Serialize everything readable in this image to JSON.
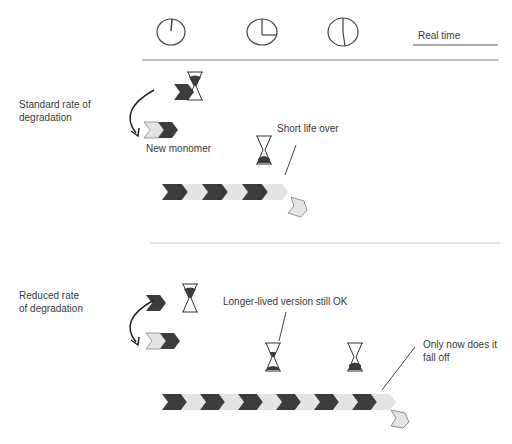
{
  "header": {
    "real_time_label": "Real time",
    "clocks": [
      {
        "name": "clock-start",
        "cx": 171,
        "cy": 32
      },
      {
        "name": "clock-quarter",
        "cx": 262,
        "cy": 32
      },
      {
        "name": "clock-half",
        "cx": 343,
        "cy": 32
      }
    ]
  },
  "panels": [
    {
      "id": "standard",
      "title": "Standard rate of degradation",
      "title_lines": [
        "Standard rate of",
        "degradation"
      ],
      "new_monomer_label": "New monomer",
      "callout": "Short life over",
      "filament_units": 6
    },
    {
      "id": "reduced",
      "title": "Reduced rate of degradation",
      "title_lines": [
        "Reduced rate",
        "of degradation"
      ],
      "callout_1": "Longer-lived version still OK",
      "callout_2_lines": [
        "Only now does it",
        "fall off"
      ],
      "filament_units": 12
    }
  ],
  "colors": {
    "dark_chevron": "#3c3c3c",
    "light_chevron": "#e4e4e4",
    "line": "#888888",
    "divider_light": "#cccccc"
  }
}
